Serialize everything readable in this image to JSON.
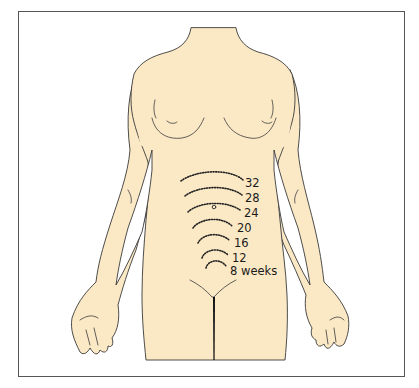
{
  "figure": {
    "skin_color": "#fbe9c6",
    "outline_color": "#3a3a3a",
    "labels": [
      {
        "text": "32",
        "x": 245,
        "y": 178
      },
      {
        "text": "28",
        "x": 245,
        "y": 193
      },
      {
        "text": "24",
        "x": 245,
        "y": 208
      },
      {
        "text": "20",
        "x": 237,
        "y": 223
      },
      {
        "text": "16",
        "x": 234,
        "y": 238
      },
      {
        "text": "12",
        "x": 232,
        "y": 253
      },
      {
        "text": "8 weeks",
        "x": 230,
        "y": 268
      }
    ]
  }
}
